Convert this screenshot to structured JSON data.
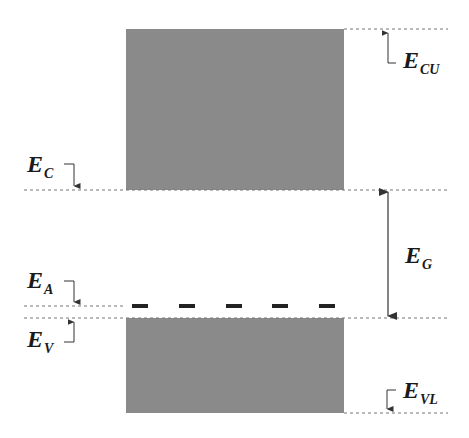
{
  "diagram": {
    "type": "semiconductor-energy-band-diagram",
    "colors": {
      "band_fill": "#8a8a8a",
      "line": "#555555",
      "dash": "#222222",
      "background": "#ffffff"
    },
    "conduction_band": {
      "name": "conduction band",
      "top_y": 29,
      "bottom_y": 190,
      "left_x": 126,
      "right_x": 344
    },
    "valence_band": {
      "name": "valence band",
      "top_y": 318,
      "bottom_y": 413,
      "left_x": 126,
      "right_x": 344
    },
    "acceptor_level": {
      "y": 306,
      "dash_count": 5
    },
    "labels": {
      "ecu": {
        "main": "E",
        "sub": "CU"
      },
      "ec": {
        "main": "E",
        "sub": "C"
      },
      "eg": {
        "main": "E",
        "sub": "G"
      },
      "ea": {
        "main": "E",
        "sub": "A"
      },
      "ev": {
        "main": "E",
        "sub": "V"
      },
      "evl": {
        "main": "E",
        "sub": "VL"
      }
    }
  }
}
